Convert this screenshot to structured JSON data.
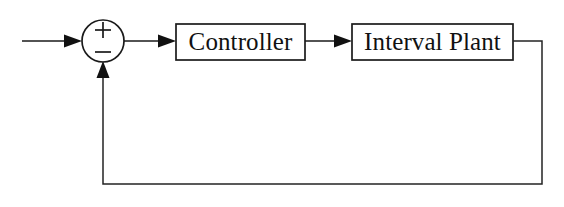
{
  "diagram": {
    "background_color": "#ffffff",
    "line_color": "#1a1a1a",
    "blocks": [
      {
        "id": "controller",
        "label": "Controller",
        "x": 176,
        "y": 24,
        "width": 129,
        "height": 36
      },
      {
        "id": "interval-plant",
        "label": "Interval Plant",
        "x": 352,
        "y": 24,
        "width": 161,
        "height": 36
      }
    ],
    "summing_junction": {
      "id": "summing-junction",
      "center_x": 103,
      "center_y": 41,
      "radius": 21,
      "plus_sign": "+",
      "minus_sign": "−",
      "plus_y": 30,
      "minus_y": 52
    },
    "signals": [
      {
        "id": "reference-input",
        "from": "external",
        "to": "summing-junction",
        "arrow": true
      },
      {
        "id": "error-signal",
        "from": "summing-junction",
        "to": "controller",
        "arrow": true
      },
      {
        "id": "control-signal",
        "from": "controller",
        "to": "interval-plant",
        "arrow": true
      },
      {
        "id": "feedback-signal",
        "from": "interval-plant",
        "to": "summing-junction",
        "arrow": true
      }
    ],
    "feedback_path": {
      "tap_x": 513,
      "tap_y": 41,
      "right_x": 542,
      "bottom_y": 184,
      "return_x": 103,
      "arrow_tip_y": 63
    }
  }
}
